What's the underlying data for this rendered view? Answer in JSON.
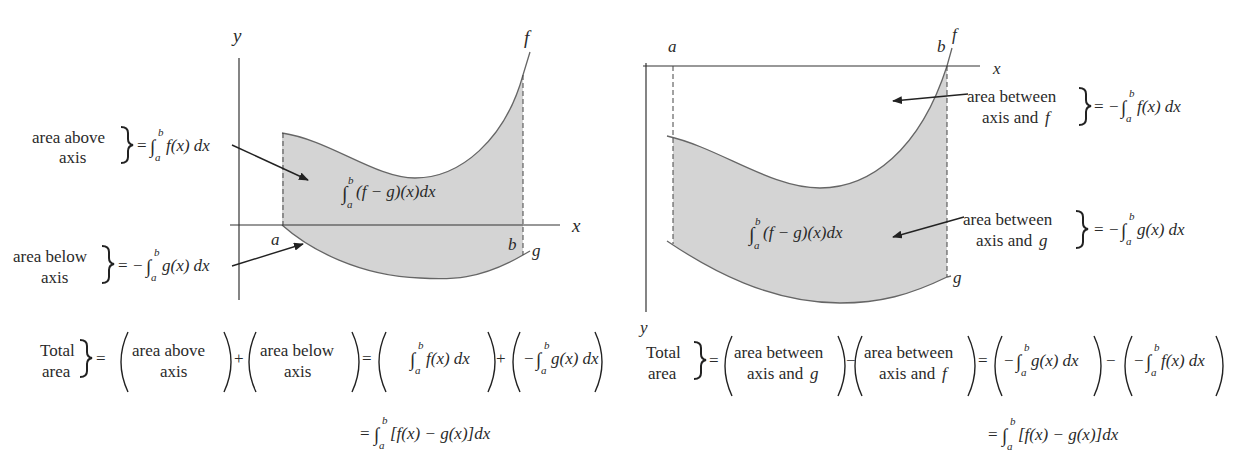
{
  "left_diagram": {
    "axis_labels": {
      "x": "x",
      "y": "y"
    },
    "curve_labels": {
      "f": "f",
      "g": "g"
    },
    "bounds": {
      "a": "a",
      "b": "b"
    },
    "region_label": {
      "integral": "∫",
      "lower": "a",
      "upper": "b",
      "body": "(f − g)(x)dx"
    },
    "annotations": [
      {
        "line1": "area above",
        "line2": "axis",
        "eq": "= ",
        "sign": "",
        "integrand": "f(x) dx"
      },
      {
        "line1": "area below",
        "line2": "axis",
        "eq": "= ",
        "sign": "−",
        "integrand": "g(x) dx"
      }
    ],
    "total": {
      "label1": "Total",
      "label2": "area",
      "term1": {
        "line1": "area above",
        "line2": "axis"
      },
      "op1": "+",
      "term2": {
        "line1": "area below",
        "line2": "axis"
      },
      "term3": {
        "sign": "",
        "integrand": "f(x) dx"
      },
      "op2": "+",
      "term4": {
        "sign": "−",
        "integrand": "g(x) dx"
      },
      "result": "[f(x) − g(x)]dx"
    }
  },
  "right_diagram": {
    "axis_labels": {
      "x": "x",
      "y": "y"
    },
    "curve_labels": {
      "f": "f",
      "g": "g"
    },
    "bounds": {
      "a": "a",
      "b": "b"
    },
    "region_label": {
      "integral": "∫",
      "lower": "a",
      "upper": "b",
      "body": "(f − g)(x)dx"
    },
    "annotations": [
      {
        "line1": "area between",
        "line2": "axis and ",
        "var": "f",
        "sign": "−",
        "integrand": "f(x) dx"
      },
      {
        "line1": "area between",
        "line2": "axis and ",
        "var": "g",
        "sign": "−",
        "integrand": "g(x) dx"
      }
    ],
    "total": {
      "label1": "Total",
      "label2": "area",
      "term1": {
        "line1": "area between",
        "line2": "axis and ",
        "var": "g"
      },
      "op1": "−",
      "term2": {
        "line1": "area between",
        "line2": "axis and ",
        "var": "f"
      },
      "term3": {
        "sign": "−",
        "integrand": "g(x) dx"
      },
      "op2": "−",
      "term4": {
        "sign": "−",
        "integrand": "f(x) dx"
      },
      "result": "[f(x) − g(x)]dx"
    }
  },
  "colors": {
    "fill": "#d4d4d4",
    "stroke": "#555555",
    "axis": "#333333",
    "text": "#2a2a2a"
  },
  "symbols": {
    "equals": "=",
    "integral": "∫",
    "lower": "a",
    "upper": "b"
  }
}
